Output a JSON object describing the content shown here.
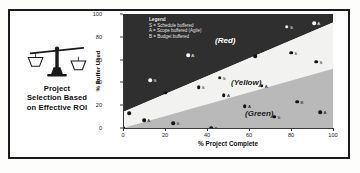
{
  "figure": {
    "caption_title": "Project Selection Based on Effective ROI",
    "caption_lines": [
      "Project",
      "Selection Based",
      "on Effective ROI"
    ],
    "icon": "balance-scales-icon"
  },
  "legend": {
    "title": "Legend",
    "entries": [
      "S = Schedule buffered",
      "A = Scope buffered (Agile)",
      "B = Budget buffered"
    ]
  },
  "colors": {
    "red_zone": "#2f2f2f",
    "yellow_zone": "#f2f2f0",
    "green_zone": "#b9b9b9",
    "frame": "#1c1c1c",
    "axis": "#3a3a3a",
    "point_dark": "#141414",
    "point_light": "#f7f7f7"
  },
  "chart_data": {
    "type": "scatter",
    "title": "",
    "xlabel": "% Project Complete",
    "ylabel": "% Buffer Used",
    "xlim": [
      0,
      100
    ],
    "ylim": [
      0,
      100
    ],
    "xticks": [
      0,
      20,
      40,
      60,
      80,
      100
    ],
    "yticks": [
      0,
      20,
      40,
      60,
      80,
      100
    ],
    "grid": false,
    "legend_position": "top-left-inside",
    "zones": [
      {
        "name": "(Red)",
        "label": "(Red)",
        "fill": "#2f2f2f",
        "label_x": 46,
        "label_y": 78
      },
      {
        "name": "(Yellow)",
        "label": "(Yellow)",
        "fill": "#f2f2f0",
        "label_x": 55,
        "label_y": 40
      },
      {
        "name": "(Green)",
        "label": "(Green)",
        "fill": "#b9b9b9",
        "label_x": 62,
        "label_y": 13
      }
    ],
    "zone_boundaries": {
      "red_yellow_line": {
        "from": [
          0,
          14
        ],
        "to": [
          100,
          92
        ]
      },
      "yellow_green_line": {
        "from": [
          0,
          0
        ],
        "to": [
          100,
          52
        ]
      }
    },
    "series": [
      {
        "name": "Projects",
        "marker": "circle",
        "points": [
          {
            "x": 3,
            "y": 13,
            "label": "S",
            "zone": "Red",
            "tone": "dark"
          },
          {
            "x": 0,
            "y": 0,
            "label": "",
            "zone": "Green",
            "tone": "dark"
          },
          {
            "x": 10,
            "y": 7,
            "label": "A",
            "zone": "Yellow",
            "tone": "dark"
          },
          {
            "x": 13,
            "y": 42,
            "label": "S",
            "zone": "Red",
            "tone": "light"
          },
          {
            "x": 20,
            "y": 31,
            "label": "S",
            "zone": "Red",
            "tone": "dark"
          },
          {
            "x": 24,
            "y": 4,
            "label": "S",
            "zone": "Green",
            "tone": "dark"
          },
          {
            "x": 31,
            "y": 64,
            "label": "A",
            "zone": "Red",
            "tone": "light"
          },
          {
            "x": 36,
            "y": 36,
            "label": "S",
            "zone": "Yellow",
            "tone": "dark"
          },
          {
            "x": 42,
            "y": 0,
            "label": "B",
            "zone": "Green",
            "tone": "dark"
          },
          {
            "x": 46,
            "y": 44,
            "label": "S",
            "zone": "Yellow",
            "tone": "dark"
          },
          {
            "x": 48,
            "y": 29,
            "label": "A",
            "zone": "Yellow",
            "tone": "dark"
          },
          {
            "x": 58,
            "y": 19,
            "label": "A",
            "zone": "Green",
            "tone": "dark"
          },
          {
            "x": 63,
            "y": 63,
            "label": "B",
            "zone": "Red",
            "tone": "dark"
          },
          {
            "x": 66,
            "y": 37,
            "label": "A",
            "zone": "Yellow",
            "tone": "dark"
          },
          {
            "x": 72,
            "y": 10,
            "label": "S",
            "zone": "Green",
            "tone": "dark"
          },
          {
            "x": 78,
            "y": 89,
            "label": "S",
            "zone": "Red",
            "tone": "light"
          },
          {
            "x": 80,
            "y": 66,
            "label": "S",
            "zone": "Yellow",
            "tone": "dark"
          },
          {
            "x": 83,
            "y": 23,
            "label": "B",
            "zone": "Green",
            "tone": "dark"
          },
          {
            "x": 91,
            "y": 92,
            "label": "A",
            "zone": "Red",
            "tone": "light"
          },
          {
            "x": 92,
            "y": 58,
            "label": "S",
            "zone": "Yellow",
            "tone": "dark"
          },
          {
            "x": 94,
            "y": 14,
            "label": "A",
            "zone": "Green",
            "tone": "dark"
          }
        ]
      }
    ]
  }
}
